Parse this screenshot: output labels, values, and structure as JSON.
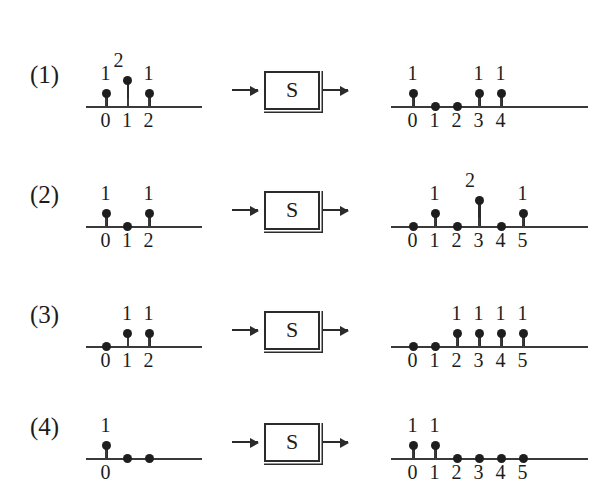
{
  "figure": {
    "system_label": "S",
    "arrow_in_name": "input-arrow",
    "arrow_out_name": "output-arrow",
    "background_color": "#ffffff",
    "ink_color": "#1c1c1c",
    "bleed_text": ""
  },
  "rows": [
    {
      "index_label": "(1)",
      "input": {
        "indices": [
          "0",
          "1",
          "2"
        ],
        "values": [
          1,
          2,
          1
        ],
        "value_labels": [
          "1",
          "2",
          "1"
        ]
      },
      "output": {
        "indices": [
          "0",
          "1",
          "2",
          "3",
          "4"
        ],
        "values": [
          1,
          0,
          0,
          1,
          1
        ],
        "value_labels": [
          "1",
          "",
          "",
          "1",
          "1"
        ]
      }
    },
    {
      "index_label": "(2)",
      "input": {
        "indices": [
          "0",
          "1",
          "2"
        ],
        "values": [
          1,
          0,
          1
        ],
        "value_labels": [
          "1",
          "",
          "1"
        ]
      },
      "output": {
        "indices": [
          "0",
          "1",
          "2",
          "3",
          "4",
          "5"
        ],
        "values": [
          0,
          1,
          0,
          2,
          0,
          1
        ],
        "value_labels": [
          "",
          "1",
          "",
          "2",
          "",
          "1"
        ]
      }
    },
    {
      "index_label": "(3)",
      "input": {
        "indices": [
          "0",
          "1",
          "2"
        ],
        "values": [
          0,
          1,
          1
        ],
        "value_labels": [
          "",
          "1",
          "1"
        ]
      },
      "output": {
        "indices": [
          "0",
          "1",
          "2",
          "3",
          "4",
          "5"
        ],
        "values": [
          0,
          0,
          1,
          1,
          1,
          1
        ],
        "value_labels": [
          "",
          "",
          "1",
          "1",
          "1",
          "1"
        ]
      }
    },
    {
      "index_label": "(4)",
      "input": {
        "indices": [
          "0",
          "",
          ""
        ],
        "values": [
          1,
          0,
          0
        ],
        "value_labels": [
          "1",
          "",
          ""
        ]
      },
      "output": {
        "indices": [
          "0",
          "1",
          "2",
          "3",
          "4",
          "5"
        ],
        "values": [
          1,
          1,
          0,
          0,
          0,
          0
        ],
        "value_labels": [
          "1",
          "1",
          "",
          "",
          "",
          ""
        ]
      }
    }
  ],
  "chart_data": {
    "type": "stem",
    "title": "",
    "xlabel": "n",
    "ylabel": "",
    "panels": [
      {
        "row": "(1)",
        "side": "input",
        "x": [
          0,
          1,
          2
        ],
        "y": [
          1,
          2,
          1
        ]
      },
      {
        "row": "(1)",
        "side": "output",
        "x": [
          0,
          1,
          2,
          3,
          4
        ],
        "y": [
          1,
          0,
          0,
          1,
          1
        ]
      },
      {
        "row": "(2)",
        "side": "input",
        "x": [
          0,
          1,
          2
        ],
        "y": [
          1,
          0,
          1
        ]
      },
      {
        "row": "(2)",
        "side": "output",
        "x": [
          0,
          1,
          2,
          3,
          4,
          5
        ],
        "y": [
          0,
          1,
          0,
          2,
          0,
          1
        ]
      },
      {
        "row": "(3)",
        "side": "input",
        "x": [
          0,
          1,
          2
        ],
        "y": [
          0,
          1,
          1
        ]
      },
      {
        "row": "(3)",
        "side": "output",
        "x": [
          0,
          1,
          2,
          3,
          4,
          5
        ],
        "y": [
          0,
          0,
          1,
          1,
          1,
          1
        ]
      },
      {
        "row": "(4)",
        "side": "input",
        "x": [
          0,
          1,
          2
        ],
        "y": [
          1,
          0,
          0
        ]
      },
      {
        "row": "(4)",
        "side": "output",
        "x": [
          0,
          1,
          2,
          3,
          4,
          5
        ],
        "y": [
          1,
          1,
          0,
          0,
          0,
          0
        ]
      }
    ]
  }
}
